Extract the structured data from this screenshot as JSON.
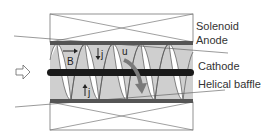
{
  "diagram": {
    "type": "schematic",
    "labels": {
      "solenoid": "Solenoid",
      "anode": "Anode",
      "cathode": "Cathode",
      "helical_baffle": "Helical baffle"
    },
    "symbols": {
      "magnetic_field": "B",
      "current_density_top": "j",
      "current_density_bottom": "j",
      "flow_velocity": "u"
    },
    "inflow_arrow": "hollow-right-arrow",
    "colors": {
      "band_fill": "#cfcfcf",
      "anode_bar": "#555555",
      "cathode_rod": "#1a1a1a",
      "outline": "#666666",
      "flow_arrow": "#7a7a7a"
    }
  }
}
